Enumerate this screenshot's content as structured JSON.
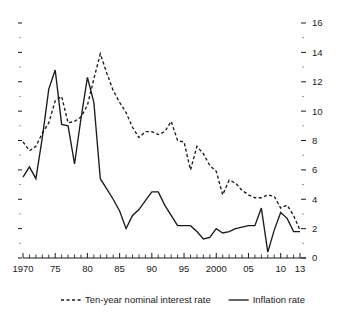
{
  "chart_data": {
    "type": "line",
    "title": "",
    "subtitle": "",
    "xlabel": "",
    "ylabel": "",
    "xlim": [
      1970,
      2013
    ],
    "ylim": [
      0,
      16
    ],
    "y_axis_position": "right",
    "y_ticks_major": [
      0,
      2,
      4,
      6,
      8,
      10,
      12,
      14,
      16
    ],
    "y_ticks_minor": [
      1,
      3,
      5,
      7,
      9,
      11,
      13,
      15
    ],
    "y_tick_labels": [
      "0",
      "2",
      "4",
      "6",
      "8",
      "10",
      "12",
      "14",
      "16"
    ],
    "x_tick_years": [
      1970,
      1975,
      1980,
      1985,
      1990,
      1995,
      2000,
      2005,
      2010,
      2013
    ],
    "x_tick_labels": [
      "1970",
      "75",
      "80",
      "85",
      "90",
      "95",
      "2000",
      "05",
      "10",
      "13"
    ],
    "grid": false,
    "legend_position": "bottom",
    "x": [
      1970,
      1971,
      1972,
      1973,
      1974,
      1975,
      1976,
      1977,
      1978,
      1979,
      1980,
      1981,
      1982,
      1983,
      1984,
      1985,
      1986,
      1987,
      1988,
      1989,
      1990,
      1991,
      1992,
      1993,
      1994,
      1995,
      1996,
      1997,
      1998,
      1999,
      2000,
      2001,
      2002,
      2003,
      2004,
      2005,
      2006,
      2007,
      2008,
      2009,
      2010,
      2011,
      2012,
      2013
    ],
    "series": [
      {
        "name": "Ten-year nominal interest rate",
        "style": "dashed",
        "color": "#1a1a1a",
        "values": [
          7.9,
          7.3,
          7.6,
          8.5,
          9.2,
          10.7,
          11.0,
          9.2,
          9.3,
          9.6,
          10.4,
          12.2,
          13.9,
          12.6,
          11.4,
          10.6,
          9.9,
          8.9,
          8.2,
          8.6,
          8.6,
          8.4,
          8.6,
          9.3,
          8.0,
          7.9,
          6.0,
          7.6,
          7.1,
          6.3,
          5.9,
          4.3,
          5.3,
          5.1,
          4.6,
          4.3,
          4.1,
          4.1,
          4.3,
          4.2,
          3.4,
          3.6,
          2.9,
          1.9
        ]
      },
      {
        "name": "Inflation rate",
        "style": "solid",
        "color": "#1a1a1a",
        "values": [
          5.5,
          6.2,
          5.4,
          8.2,
          11.5,
          12.8,
          9.1,
          9.0,
          6.4,
          9.5,
          12.3,
          10.6,
          5.4,
          4.7,
          4.0,
          3.2,
          2.0,
          2.9,
          3.3,
          3.9,
          4.5,
          4.5,
          3.6,
          2.9,
          2.2,
          2.2,
          2.2,
          1.8,
          1.3,
          1.4,
          2.0,
          1.7,
          1.8,
          2.0,
          2.1,
          2.2,
          2.2,
          3.4,
          0.4,
          1.9,
          3.1,
          2.7,
          1.8,
          1.8
        ]
      }
    ],
    "legend": [
      {
        "label": "Ten-year nominal interest rate",
        "style": "dashed"
      },
      {
        "label": "Inflation rate",
        "style": "solid"
      }
    ]
  }
}
